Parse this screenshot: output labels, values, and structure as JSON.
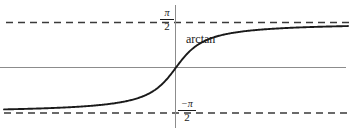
{
  "figure": {
    "title": "",
    "background_color": "#ffffff",
    "width": 354,
    "height": 137
  },
  "labels": {
    "curve_label": "arctan",
    "asymptote_top": {
      "numerator": "π",
      "denominator": "2",
      "full": "π/2"
    },
    "asymptote_bottom": {
      "numerator": "−π",
      "denominator": "2",
      "full": "−π/2"
    }
  },
  "colors": {
    "curve": "#1a1a1a",
    "axis": "#8c8c8c",
    "asymptote": "#3a3a3a",
    "text": "#1a1a1a",
    "background": "#ffffff"
  },
  "chart_data": {
    "type": "line",
    "title": "",
    "subtitle": "",
    "xlabel": "",
    "ylabel": "",
    "xlim": [
      -8,
      8
    ],
    "ylim": [
      -1.7708,
      1.7708
    ],
    "grid": false,
    "legend": "none",
    "annotations": [
      {
        "text": "arctan",
        "x": 0.55,
        "y": 1.12,
        "note": "curve name placed above the rising branch"
      },
      {
        "text": "π/2",
        "x": -0.35,
        "y": 1.571,
        "note": "upper horizontal asymptote value, left of y-axis"
      },
      {
        "text": "−π/2",
        "x": 0.35,
        "y": -1.571,
        "note": "lower horizontal asymptote value, right of y-axis"
      }
    ],
    "asymptotes": [
      {
        "type": "horizontal",
        "y": 1.5708,
        "style": "dashed",
        "label": "π/2"
      },
      {
        "type": "horizontal",
        "y": -1.5708,
        "style": "dashed",
        "label": "−π/2"
      }
    ],
    "axes": [
      {
        "type": "horizontal",
        "y": 0,
        "style": "solid",
        "color": "#8c8c8c"
      },
      {
        "type": "vertical",
        "x": 0,
        "style": "solid",
        "color": "#8c8c8c"
      }
    ],
    "series": [
      {
        "name": "arctan",
        "function": "y = arctan(x)",
        "x": [
          -8,
          -7.5,
          -7,
          -6.5,
          -6,
          -5.5,
          -5,
          -4.5,
          -4,
          -3.5,
          -3,
          -2.5,
          -2,
          -1.5,
          -1,
          -0.75,
          -0.5,
          -0.25,
          0,
          0.25,
          0.5,
          0.75,
          1,
          1.5,
          2,
          2.5,
          3,
          3.5,
          4,
          4.5,
          5,
          5.5,
          6,
          6.5,
          7,
          7.5,
          8
        ],
        "y": [
          -1.446,
          -1.438,
          -1.429,
          -1.418,
          -1.406,
          -1.391,
          -1.373,
          -1.352,
          -1.326,
          -1.292,
          -1.249,
          -1.19,
          -1.107,
          -0.983,
          -0.785,
          -0.644,
          -0.464,
          -0.245,
          0,
          0.245,
          0.464,
          0.644,
          0.785,
          0.983,
          1.107,
          1.19,
          1.249,
          1.292,
          1.326,
          1.352,
          1.373,
          1.391,
          1.406,
          1.418,
          1.429,
          1.438,
          1.446
        ]
      }
    ]
  }
}
